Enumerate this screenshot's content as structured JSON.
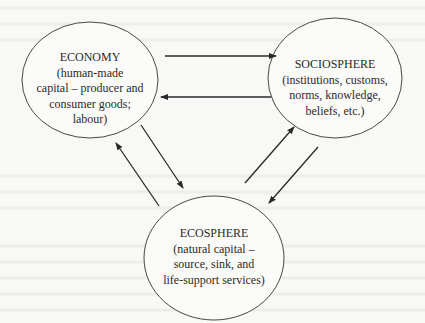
{
  "diagram": {
    "nodes": [
      {
        "id": "economy",
        "title": "ECONOMY",
        "description_lines": [
          "(human-made",
          "capital – producer and",
          "consumer goods;",
          "labour)"
        ]
      },
      {
        "id": "sociosphere",
        "title": "SOCIOSPHERE",
        "description_lines": [
          "(institutions, customs,",
          "norms, knowledge,",
          "beliefs, etc.)"
        ]
      },
      {
        "id": "ecosphere",
        "title": "ECOSPHERE",
        "description_lines": [
          "(natural capital –",
          "source, sink, and",
          "life-support services)"
        ]
      }
    ],
    "edges": [
      {
        "from": "economy",
        "to": "sociosphere"
      },
      {
        "from": "sociosphere",
        "to": "economy"
      },
      {
        "from": "economy",
        "to": "ecosphere"
      },
      {
        "from": "ecosphere",
        "to": "economy"
      },
      {
        "from": "ecosphere",
        "to": "sociosphere"
      },
      {
        "from": "sociosphere",
        "to": "ecosphere"
      }
    ],
    "colors": {
      "line": "#2a2a2a",
      "background": "#f8f8f7"
    }
  }
}
